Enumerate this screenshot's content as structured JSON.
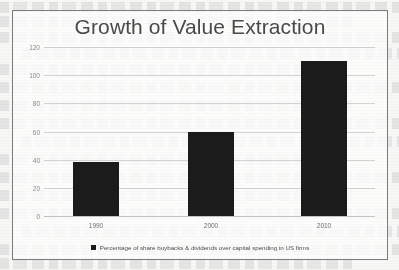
{
  "chart_data": {
    "type": "bar",
    "title": "Growth of Value Extraction",
    "categories": [
      "1990",
      "2000",
      "2010"
    ],
    "values": [
      38,
      60,
      110
    ],
    "series": [
      {
        "name": "Percentage of share buybacks & dividends over capital spending in US firms",
        "values": [
          38,
          60,
          110
        ]
      }
    ],
    "xlabel": "",
    "ylabel": "",
    "ylim": [
      0,
      120
    ],
    "yticks": [
      "0",
      "20",
      "40",
      "60",
      "80",
      "100",
      "120"
    ],
    "grid": true,
    "legend_position": "bottom",
    "bar_color": "#1b1b1b"
  },
  "legend": {
    "label": "Percentage of share buybacks & dividends over capital spending in US firms",
    "swatch_name": "legend-color-swatch"
  }
}
